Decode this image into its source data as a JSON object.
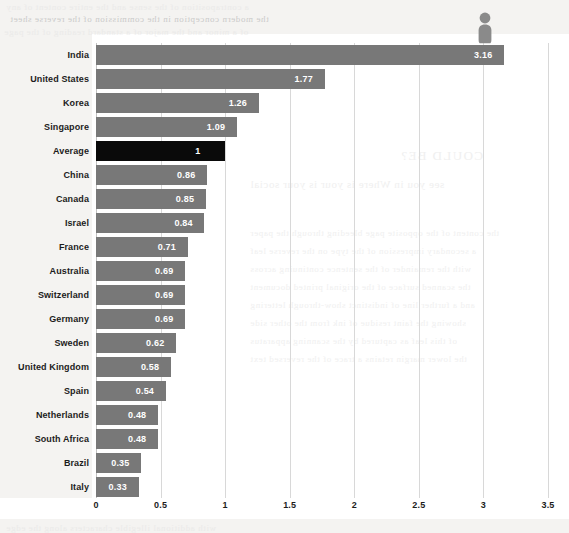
{
  "chart_data": {
    "type": "bar",
    "orientation": "horizontal",
    "title": "",
    "subtitle": "",
    "xlabel": "",
    "ylabel": "",
    "xlim": [
      0,
      3.5
    ],
    "xticks": [
      "0",
      "0.5",
      "1",
      "1.5",
      "2",
      "2.5",
      "3",
      "3.5"
    ],
    "xtick_values": [
      0,
      0.5,
      1,
      1.5,
      2,
      2.5,
      3,
      3.5
    ],
    "grid": true,
    "legend": false,
    "sorted": "descending",
    "highlight_category": "Average",
    "highlight_color": "#0a0a0a",
    "bar_color": "#787878",
    "categories": [
      "India",
      "United States",
      "Korea",
      "Singapore",
      "Average",
      "China",
      "Canada",
      "Israel",
      "France",
      "Australia",
      "Switzerland",
      "Germany",
      "Sweden",
      "United Kingdom",
      "Spain",
      "Netherlands",
      "South Africa",
      "Brazil",
      "Italy"
    ],
    "values": [
      3.16,
      1.77,
      1.26,
      1.09,
      1,
      0.86,
      0.85,
      0.84,
      0.71,
      0.69,
      0.69,
      0.69,
      0.62,
      0.58,
      0.54,
      0.48,
      0.48,
      0.35,
      0.33
    ],
    "value_labels": [
      "3.16",
      "1.77",
      "1.26",
      "1.09",
      "1",
      "0.86",
      "0.85",
      "0.84",
      "0.71",
      "0.69",
      "0.69",
      "0.69",
      "0.62",
      "0.58",
      "0.54",
      "0.48",
      "0.48",
      "0.35",
      "0.33"
    ],
    "annotations": [
      {
        "name": "person-pictogram",
        "icon": "person-standing-icon",
        "on_category": "India",
        "color": "#8a8a8a"
      }
    ]
  },
  "scan_background": {
    "description": "faint mirrored show-through text from reverse of scanned page",
    "lines": [
      "a contraposition of the sense and the entire content of any",
      "the modern conception in the commission of the reverse sheet",
      "of a minor and the major of a standard reading of the page",
      "COULD BE?",
      "see you in Where is your is your social",
      "the content of the opposite page bleeding through the paper",
      "a secondary impression of the type on the reverse leaf",
      "with the remainder of the sentence continuing across",
      "the scanned surface of the original printed document",
      "and a further line of indistinct show-through lettering",
      "showing the faint residue of ink from the other side",
      "of this leaf as captured by the scanning apparatus",
      "the lower margin retains a trace of the reversed text",
      "with additional illegible characters along the edge"
    ]
  }
}
